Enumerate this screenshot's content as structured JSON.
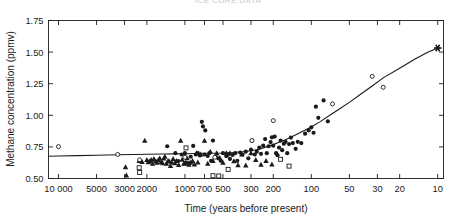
{
  "figure": {
    "clipped_header_text": "ICE CORE DATA",
    "background_color": "#ffffff",
    "ink_color": "#1a1a1a"
  },
  "chart_data": {
    "type": "scatter",
    "title": "",
    "xlabel": "Time (years before present)",
    "ylabel": "Methane concentration (ppmv)",
    "x_scale": "log-reversed",
    "xlim": [
      12000,
      9
    ],
    "ylim": [
      0.5,
      1.75
    ],
    "grid": false,
    "legend_position": "none",
    "x_ticks": [
      10000,
      5000,
      3000,
      2000,
      1000,
      700,
      500,
      300,
      200,
      100,
      50,
      30,
      20,
      10
    ],
    "x_tick_labels": [
      "10 000",
      "5000",
      "3000",
      "2000",
      "1000",
      "700",
      "500",
      "300",
      "200",
      "100",
      "50",
      "30",
      "20",
      "10"
    ],
    "y_ticks": [
      0.5,
      0.75,
      1.0,
      1.25,
      1.5,
      1.75
    ],
    "y_tick_labels": [
      "0.50",
      "0.75",
      "1.00",
      "1.25",
      "1.50",
      "1.75"
    ],
    "series": [
      {
        "name": "filled-circles",
        "marker": "filled-circle",
        "points": [
          [
            1380,
            0.755
          ],
          [
            1190,
            0.7
          ],
          [
            1130,
            0.638
          ],
          [
            1060,
            0.69
          ],
          [
            1000,
            0.7
          ],
          [
            980,
            0.625
          ],
          [
            930,
            0.622
          ],
          [
            900,
            0.672
          ],
          [
            860,
            0.758
          ],
          [
            820,
            0.69
          ],
          [
            790,
            0.7
          ],
          [
            760,
            0.682
          ],
          [
            735,
            0.948
          ],
          [
            720,
            0.912
          ],
          [
            700,
            0.69
          ],
          [
            690,
            0.88
          ],
          [
            660,
            0.678
          ],
          [
            640,
            0.7
          ],
          [
            620,
            0.64
          ],
          [
            600,
            0.8
          ],
          [
            570,
            0.672
          ],
          [
            545,
            0.66
          ],
          [
            520,
            0.64
          ],
          [
            500,
            0.7
          ],
          [
            470,
            0.676
          ],
          [
            455,
            0.69
          ],
          [
            440,
            0.655
          ],
          [
            420,
            0.686
          ],
          [
            400,
            0.7
          ],
          [
            385,
            0.64
          ],
          [
            365,
            0.705
          ],
          [
            350,
            0.69
          ],
          [
            330,
            0.712
          ],
          [
            315,
            0.66
          ],
          [
            300,
            0.728
          ],
          [
            295,
            0.8
          ],
          [
            280,
            0.69
          ],
          [
            270,
            0.712
          ],
          [
            258,
            0.744
          ],
          [
            250,
            0.695
          ],
          [
            240,
            0.76
          ],
          [
            232,
            0.812
          ],
          [
            225,
            0.7
          ],
          [
            218,
            0.755
          ],
          [
            210,
            0.788
          ],
          [
            205,
            0.826
          ],
          [
            200,
            0.76
          ],
          [
            195,
            0.832
          ],
          [
            190,
            0.7
          ],
          [
            185,
            0.684
          ],
          [
            180,
            0.745
          ],
          [
            175,
            0.8
          ],
          [
            170,
            0.724
          ],
          [
            165,
            0.775
          ],
          [
            160,
            0.79
          ],
          [
            155,
            0.7
          ],
          [
            150,
            0.772
          ],
          [
            145,
            0.824
          ],
          [
            140,
            0.78
          ],
          [
            133,
            0.735
          ],
          [
            128,
            0.79
          ],
          [
            120,
            0.78
          ],
          [
            112,
            0.855
          ],
          [
            105,
            0.88
          ],
          [
            100,
            0.905
          ],
          [
            96,
            0.862
          ],
          [
            92,
            1.068
          ],
          [
            88,
            0.98
          ],
          [
            80,
            1.118
          ],
          [
            74,
            0.952
          ]
        ]
      },
      {
        "name": "filled-triangles",
        "marker": "filled-triangle",
        "points": [
          [
            2950,
            0.59
          ],
          [
            2900,
            0.525
          ],
          [
            2300,
            0.64
          ],
          [
            2180,
            0.632
          ],
          [
            2080,
            0.8
          ],
          [
            2000,
            0.648
          ],
          [
            1950,
            0.63
          ],
          [
            1900,
            0.636
          ],
          [
            1850,
            0.648
          ],
          [
            1800,
            0.618
          ],
          [
            1760,
            0.655
          ],
          [
            1700,
            0.638
          ],
          [
            1660,
            0.625
          ],
          [
            1620,
            0.648
          ],
          [
            1580,
            0.66
          ],
          [
            1540,
            0.632
          ],
          [
            1500,
            0.622
          ],
          [
            1470,
            0.658
          ],
          [
            1440,
            0.672
          ],
          [
            1400,
            0.618
          ],
          [
            1360,
            0.64
          ],
          [
            1330,
            0.635
          ],
          [
            1300,
            0.6
          ],
          [
            1270,
            0.628
          ],
          [
            1240,
            0.655
          ],
          [
            1200,
            0.622
          ],
          [
            1170,
            0.64
          ],
          [
            1120,
            0.608
          ],
          [
            1080,
            0.8
          ],
          [
            1050,
            0.65
          ],
          [
            1020,
            0.618
          ],
          [
            990,
            0.62
          ],
          [
            960,
            0.66
          ],
          [
            930,
            0.61
          ],
          [
            900,
            0.625
          ],
          [
            870,
            0.64
          ],
          [
            840,
            0.612
          ],
          [
            810,
            0.7
          ],
          [
            790,
            0.628
          ],
          [
            750,
            0.69
          ],
          [
            700,
            0.8
          ],
          [
            660,
            0.618
          ],
          [
            630,
            0.712
          ],
          [
            600,
            0.64
          ],
          [
            560,
            0.7
          ],
          [
            530,
            0.662
          ],
          [
            500,
            0.625
          ],
          [
            470,
            0.7
          ],
          [
            440,
            0.7
          ],
          [
            410,
            0.638
          ],
          [
            380,
            0.605
          ],
          [
            355,
            0.69
          ],
          [
            330,
            0.604
          ],
          [
            300,
            0.7
          ],
          [
            275,
            0.648
          ],
          [
            250,
            0.61
          ],
          [
            228,
            0.64
          ],
          [
            205,
            0.612
          ]
        ]
      },
      {
        "name": "open-circles",
        "marker": "open-circle",
        "points": [
          [
            10000,
            0.752
          ],
          [
            3400,
            0.69
          ],
          [
            2280,
            0.648
          ],
          [
            1000,
            0.668
          ],
          [
            580,
            0.668
          ],
          [
            295,
            0.8
          ],
          [
            200,
            0.958
          ],
          [
            68,
            1.09
          ],
          [
            33,
            1.308
          ],
          [
            27,
            1.222
          ]
        ]
      },
      {
        "name": "open-squares",
        "marker": "open-square",
        "points": [
          [
            2300,
            0.585
          ],
          [
            2280,
            0.548
          ],
          [
            980,
            0.742
          ],
          [
            600,
            0.522
          ],
          [
            540,
            0.52
          ],
          [
            455,
            0.572
          ],
          [
            175,
            0.652
          ],
          [
            150,
            0.598
          ]
        ]
      },
      {
        "name": "modern-measurement",
        "marker": "asterisk",
        "points": [
          [
            10,
            1.532
          ]
        ]
      }
    ],
    "fit_curve": {
      "name": "fitted-trend",
      "style": "solid-line",
      "points": [
        [
          12000,
          0.676
        ],
        [
          10000,
          0.678
        ],
        [
          7000,
          0.681
        ],
        [
          5000,
          0.684
        ],
        [
          3400,
          0.688
        ],
        [
          2500,
          0.69
        ],
        [
          2000,
          0.692
        ],
        [
          1500,
          0.694
        ],
        [
          1200,
          0.695
        ],
        [
          1000,
          0.696
        ],
        [
          800,
          0.698
        ],
        [
          700,
          0.7
        ],
        [
          600,
          0.7
        ],
        [
          500,
          0.702
        ],
        [
          420,
          0.706
        ],
        [
          350,
          0.712
        ],
        [
          300,
          0.72
        ],
        [
          260,
          0.732
        ],
        [
          230,
          0.748
        ],
        [
          200,
          0.768
        ],
        [
          180,
          0.786
        ],
        [
          160,
          0.806
        ],
        [
          140,
          0.834
        ],
        [
          120,
          0.868
        ],
        [
          100,
          0.908
        ],
        [
          85,
          0.95
        ],
        [
          70,
          1.006
        ],
        [
          60,
          1.05
        ],
        [
          50,
          1.102
        ],
        [
          40,
          1.172
        ],
        [
          33,
          1.232
        ],
        [
          27,
          1.296
        ],
        [
          20,
          1.372
        ],
        [
          15,
          1.448
        ],
        [
          12,
          1.498
        ],
        [
          10,
          1.532
        ]
      ]
    }
  }
}
